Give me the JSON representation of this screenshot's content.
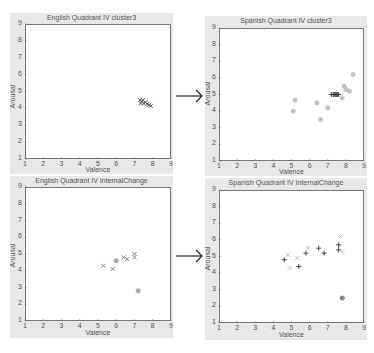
{
  "chart_data": [
    {
      "type": "scatter",
      "title": "English Quadrant IV cluster3",
      "xlabel": "Valence",
      "ylabel": "Arousal",
      "xlim": [
        1,
        9
      ],
      "ylim": [
        1,
        9
      ],
      "xticks": [
        1,
        2,
        3,
        4,
        5,
        6,
        7,
        8,
        9
      ],
      "yticks": [
        1,
        2,
        3,
        4,
        5,
        6,
        7,
        8,
        9
      ],
      "grid": false,
      "series": [
        {
          "name": "points",
          "marker": "x",
          "points": [
            [
              7.3,
              4.5
            ],
            [
              7.4,
              4.4
            ],
            [
              7.5,
              4.3
            ],
            [
              7.6,
              4.35
            ],
            [
              7.7,
              4.25
            ],
            [
              7.8,
              4.2
            ],
            [
              7.9,
              4.15
            ],
            [
              7.45,
              4.5
            ],
            [
              7.35,
              4.3
            ]
          ]
        }
      ]
    },
    {
      "type": "scatter",
      "title": "Spanish Quadrant IV cluster3",
      "xlabel": "Valence",
      "ylabel": "Arousal",
      "xlim": [
        1,
        9
      ],
      "ylim": [
        1,
        9
      ],
      "xticks": [
        1,
        2,
        3,
        4,
        5,
        6,
        7,
        8,
        9
      ],
      "yticks": [
        1,
        2,
        3,
        4,
        5,
        6,
        7,
        8,
        9
      ],
      "grid": false,
      "series": [
        {
          "name": "dense",
          "marker": "+",
          "points": [
            [
              7.2,
              5.0
            ],
            [
              7.3,
              5.0
            ],
            [
              7.35,
              5.0
            ],
            [
              7.4,
              5.0
            ],
            [
              7.45,
              5.0
            ],
            [
              7.5,
              5.0
            ],
            [
              7.55,
              5.0
            ],
            [
              7.6,
              5.0
            ]
          ]
        },
        {
          "name": "light",
          "marker": "o",
          "points": [
            [
              5.1,
              4.0
            ],
            [
              5.2,
              4.65
            ],
            [
              6.4,
              4.5
            ],
            [
              6.6,
              3.5
            ],
            [
              7.0,
              4.2
            ],
            [
              7.8,
              4.8
            ],
            [
              7.9,
              5.5
            ],
            [
              8.0,
              5.3
            ],
            [
              8.2,
              5.2
            ],
            [
              8.4,
              6.2
            ]
          ]
        }
      ]
    },
    {
      "type": "scatter",
      "title": "English Quadrant IV InternalChange",
      "xlabel": "Valence",
      "ylabel": "Arousal",
      "xlim": [
        1,
        9
      ],
      "ylim": [
        1,
        9
      ],
      "xticks": [
        1,
        2,
        3,
        4,
        5,
        6,
        7,
        8,
        9
      ],
      "yticks": [
        1,
        2,
        3,
        4,
        5,
        6,
        7,
        8,
        9
      ],
      "grid": false,
      "series": [
        {
          "name": "x-markers",
          "marker": "x",
          "points": [
            [
              5.3,
              4.3
            ],
            [
              5.8,
              4.1
            ],
            [
              6.4,
              4.8
            ],
            [
              6.6,
              4.7
            ],
            [
              7.0,
              5.0
            ],
            [
              7.0,
              4.8
            ]
          ]
        },
        {
          "name": "circle-markers",
          "marker": "o",
          "points": [
            [
              6.0,
              4.6
            ],
            [
              7.2,
              2.8
            ]
          ]
        }
      ]
    },
    {
      "type": "scatter",
      "title": "Spanish Quadrant IV InternalChange",
      "xlabel": "Valence",
      "ylabel": "Arousal",
      "xlim": [
        1,
        9
      ],
      "ylim": [
        1,
        9
      ],
      "xticks": [
        1,
        2,
        3,
        4,
        5,
        6,
        7,
        8,
        9
      ],
      "yticks": [
        1,
        2,
        3,
        4,
        5,
        6,
        7,
        8,
        9
      ],
      "grid": false,
      "series": [
        {
          "name": "dark-plus",
          "marker": "+",
          "points": [
            [
              4.6,
              4.8
            ],
            [
              5.4,
              4.4
            ],
            [
              5.8,
              5.2
            ],
            [
              6.5,
              5.5
            ],
            [
              6.8,
              5.2
            ],
            [
              7.6,
              5.7
            ],
            [
              7.6,
              5.4
            ]
          ]
        },
        {
          "name": "dark-circle",
          "marker": "o",
          "points": [
            [
              7.8,
              2.5
            ]
          ]
        },
        {
          "name": "light",
          "marker": "x",
          "points": [
            [
              4.8,
              5.1
            ],
            [
              4.9,
              4.3
            ],
            [
              5.3,
              4.9
            ],
            [
              5.9,
              5.5
            ],
            [
              7.7,
              6.2
            ],
            [
              7.8,
              5.3
            ]
          ]
        }
      ]
    }
  ],
  "panels": [
    {
      "title": "English Quadrant IV cluster3",
      "xlabel": "Valence",
      "ylabel": "Arousal"
    },
    {
      "title": "Spanish Quadrant IV cluster3",
      "xlabel": "Valence",
      "ylabel": "Arousal"
    },
    {
      "title": "English Quadrant IV InternalChange",
      "xlabel": "Valence",
      "ylabel": "Arousal"
    },
    {
      "title": "Spanish Quadrant IV InternalChange",
      "xlabel": "Valence",
      "ylabel": "Arousal"
    }
  ],
  "ticks": [
    "1",
    "2",
    "3",
    "4",
    "5",
    "6",
    "7",
    "8",
    "9"
  ],
  "arrows": [
    {
      "glyph": "right-arrow"
    },
    {
      "glyph": "right-arrow"
    }
  ]
}
